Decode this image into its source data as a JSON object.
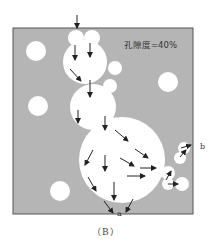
{
  "figure": {
    "porosity_label": "孔隙度=40%",
    "outlet_label": "a",
    "side_label": "b",
    "caption": "（B）"
  },
  "colors": {
    "matrix": "#b5b5b5",
    "pore": "#ffffff",
    "border": "#555555",
    "arrow": "#222222"
  },
  "pores": [
    {
      "cx": 36,
      "cy": 51,
      "r": 10
    },
    {
      "cx": 168,
      "cy": 82,
      "r": 10
    },
    {
      "cx": 38,
      "cy": 106,
      "r": 10
    },
    {
      "cx": 60,
      "cy": 191,
      "r": 10
    },
    {
      "cx": 76,
      "cy": 38,
      "r": 8
    },
    {
      "cx": 92,
      "cy": 38,
      "r": 8
    },
    {
      "cx": 85,
      "cy": 62,
      "r": 22
    },
    {
      "cx": 115,
      "cy": 68,
      "r": 7
    },
    {
      "cx": 110,
      "cy": 86,
      "r": 7
    },
    {
      "cx": 93,
      "cy": 107,
      "r": 23
    },
    {
      "cx": 122,
      "cy": 160,
      "r": 43
    },
    {
      "cx": 184,
      "cy": 148,
      "r": 6
    },
    {
      "cx": 180,
      "cy": 158,
      "r": 6
    },
    {
      "cx": 168,
      "cy": 173,
      "r": 7
    },
    {
      "cx": 168,
      "cy": 184,
      "r": 6
    },
    {
      "cx": 182,
      "cy": 184,
      "r": 7
    }
  ],
  "arrows": [
    {
      "x1": 77,
      "y1": 15,
      "x2": 77,
      "y2": 28
    },
    {
      "x1": 75,
      "y1": 45,
      "x2": 75,
      "y2": 60
    },
    {
      "x1": 90,
      "y1": 43,
      "x2": 90,
      "y2": 57
    },
    {
      "x1": 70,
      "y1": 69,
      "x2": 81,
      "y2": 81
    },
    {
      "x1": 90,
      "y1": 80,
      "x2": 90,
      "y2": 97
    },
    {
      "x1": 78,
      "y1": 110,
      "x2": 78,
      "y2": 123
    },
    {
      "x1": 105,
      "y1": 116,
      "x2": 105,
      "y2": 130
    },
    {
      "x1": 115,
      "y1": 130,
      "x2": 128,
      "y2": 141
    },
    {
      "x1": 135,
      "y1": 149,
      "x2": 148,
      "y2": 158
    },
    {
      "x1": 120,
      "y1": 158,
      "x2": 134,
      "y2": 166
    },
    {
      "x1": 140,
      "y1": 168,
      "x2": 156,
      "y2": 168
    },
    {
      "x1": 127,
      "y1": 176,
      "x2": 145,
      "y2": 176
    },
    {
      "x1": 93,
      "y1": 150,
      "x2": 85,
      "y2": 165
    },
    {
      "x1": 105,
      "y1": 155,
      "x2": 105,
      "y2": 171
    },
    {
      "x1": 88,
      "y1": 177,
      "x2": 96,
      "y2": 191
    },
    {
      "x1": 114,
      "y1": 182,
      "x2": 114,
      "y2": 200
    },
    {
      "x1": 104,
      "y1": 201,
      "x2": 113,
      "y2": 213
    },
    {
      "x1": 133,
      "y1": 199,
      "x2": 126,
      "y2": 212
    },
    {
      "x1": 166,
      "y1": 180,
      "x2": 171,
      "y2": 171
    },
    {
      "x1": 168,
      "y1": 184,
      "x2": 178,
      "y2": 184
    },
    {
      "x1": 180,
      "y1": 157,
      "x2": 186,
      "y2": 150
    },
    {
      "x1": 181,
      "y1": 148,
      "x2": 191,
      "y2": 145
    }
  ]
}
